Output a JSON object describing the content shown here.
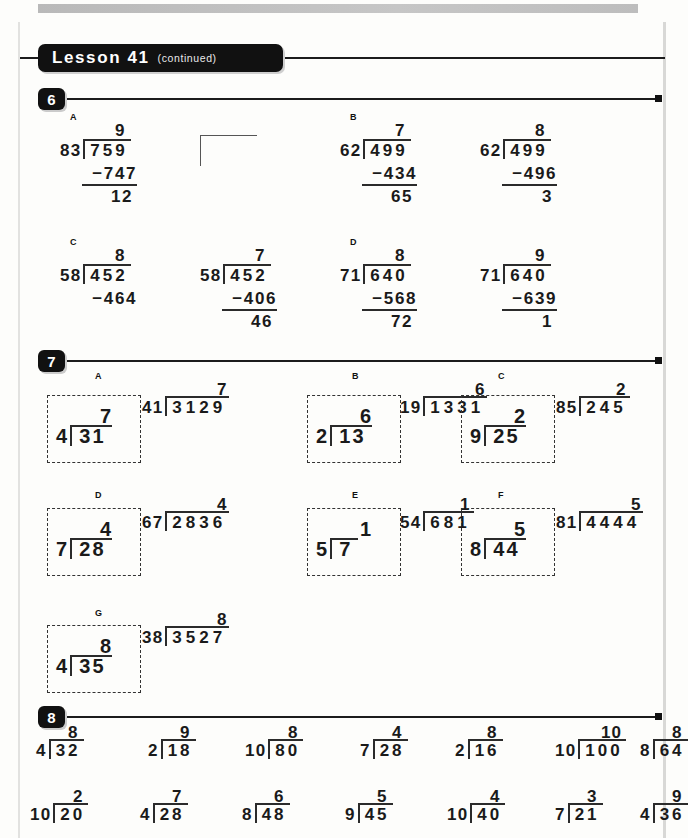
{
  "page": {
    "lesson_title": "Lesson 41",
    "lesson_note": "(continued)"
  },
  "sections": [
    {
      "number": "6"
    },
    {
      "number": "7"
    },
    {
      "number": "8"
    }
  ],
  "section6": {
    "items": [
      {
        "tag": "A",
        "parts": [
          {
            "divisor": "83",
            "dividend": "759",
            "quotient": "9",
            "subtrahend": "747",
            "remainder": "12",
            "subline": true
          },
          {
            "empty": true
          }
        ]
      },
      {
        "tag": "B",
        "parts": [
          {
            "divisor": "62",
            "dividend": "499",
            "quotient": "7",
            "subtrahend": "434",
            "remainder": "65",
            "subline": true
          },
          {
            "divisor": "62",
            "dividend": "499",
            "quotient": "8",
            "subtrahend": "496",
            "remainder": "3",
            "subline": true
          }
        ]
      },
      {
        "tag": "C",
        "parts": [
          {
            "divisor": "58",
            "dividend": "452",
            "quotient": "8",
            "subtrahend": "464",
            "remainder": "",
            "subline": false
          },
          {
            "divisor": "58",
            "dividend": "452",
            "quotient": "7",
            "subtrahend": "406",
            "remainder": "46",
            "subline": true
          }
        ]
      },
      {
        "tag": "D",
        "parts": [
          {
            "divisor": "71",
            "dividend": "640",
            "quotient": "8",
            "subtrahend": "568",
            "remainder": "72",
            "subline": true
          },
          {
            "divisor": "71",
            "dividend": "640",
            "quotient": "9",
            "subtrahend": "639",
            "remainder": "1",
            "subline": true
          }
        ]
      }
    ]
  },
  "section7": {
    "items": [
      {
        "tag": "A",
        "boxed": {
          "divisor": "4",
          "dividend": "31",
          "quotient": "7"
        },
        "open": {
          "divisor": "41",
          "dividend": "3129",
          "quotient": "7"
        }
      },
      {
        "tag": "B",
        "boxed": {
          "divisor": "2",
          "dividend": "13",
          "quotient": "6"
        },
        "open": {
          "divisor": "19",
          "dividend": "1331",
          "quotient": "6"
        }
      },
      {
        "tag": "C",
        "boxed": {
          "divisor": "9",
          "dividend": "25",
          "quotient": "2"
        },
        "open": {
          "divisor": "85",
          "dividend": "245",
          "quotient": "2"
        }
      },
      {
        "tag": "D",
        "boxed": {
          "divisor": "7",
          "dividend": "28",
          "quotient": "4"
        },
        "open": {
          "divisor": "67",
          "dividend": "2836",
          "quotient": "4"
        }
      },
      {
        "tag": "E",
        "boxed": {
          "divisor": "5",
          "dividend": "7",
          "quotient": "1"
        },
        "open": {
          "divisor": "54",
          "dividend": "681",
          "quotient": "1"
        }
      },
      {
        "tag": "F",
        "boxed": {
          "divisor": "8",
          "dividend": "44",
          "quotient": "5"
        },
        "open": {
          "divisor": "81",
          "dividend": "4444",
          "quotient": "5"
        }
      },
      {
        "tag": "G",
        "boxed": {
          "divisor": "4",
          "dividend": "35",
          "quotient": "8"
        },
        "open": {
          "divisor": "38",
          "dividend": "3527",
          "quotient": "8"
        }
      }
    ]
  },
  "section8": {
    "row1": [
      {
        "divisor": "4",
        "dividend": "32",
        "quotient": "8"
      },
      {
        "divisor": "2",
        "dividend": "18",
        "quotient": "9"
      },
      {
        "divisor": "10",
        "dividend": "80",
        "quotient": "8"
      },
      {
        "divisor": "7",
        "dividend": "28",
        "quotient": "4"
      },
      {
        "divisor": "2",
        "dividend": "16",
        "quotient": "8"
      },
      {
        "divisor": "10",
        "dividend": "100",
        "quotient": "10"
      },
      {
        "divisor": "8",
        "dividend": "64",
        "quotient": "8"
      }
    ],
    "row2": [
      {
        "divisor": "10",
        "dividend": "20",
        "quotient": "2"
      },
      {
        "divisor": "4",
        "dividend": "28",
        "quotient": "7"
      },
      {
        "divisor": "8",
        "dividend": "48",
        "quotient": "6"
      },
      {
        "divisor": "9",
        "dividend": "45",
        "quotient": "5"
      },
      {
        "divisor": "10",
        "dividend": "40",
        "quotient": "4"
      },
      {
        "divisor": "7",
        "dividend": "21",
        "quotient": "3"
      },
      {
        "divisor": "4",
        "dividend": "36",
        "quotient": "9"
      }
    ]
  }
}
